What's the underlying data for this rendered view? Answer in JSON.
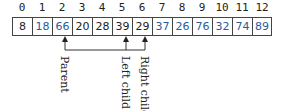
{
  "array": {
    "indices": [
      "0",
      "1",
      "2",
      "3",
      "4",
      "5",
      "6",
      "7",
      "8",
      "9",
      "10",
      "11",
      "12"
    ],
    "values": [
      "8",
      "18",
      "66",
      "20",
      "28",
      "39",
      "29",
      "37",
      "26",
      "76",
      "32",
      "74",
      "89"
    ],
    "colors": [
      "#222222",
      "#2a5b9a",
      "#2a5b9a",
      "#222222",
      "#222222",
      "#222222",
      "#222222",
      "#2a5b9a",
      "#2a5b9a",
      "#2a5b9a",
      "#2a5b9a",
      "#2a5b9a",
      "#2a5b9a"
    ]
  },
  "labels": {
    "parent": "Parent",
    "left_child": "Left child",
    "right_child": "Right child"
  }
}
